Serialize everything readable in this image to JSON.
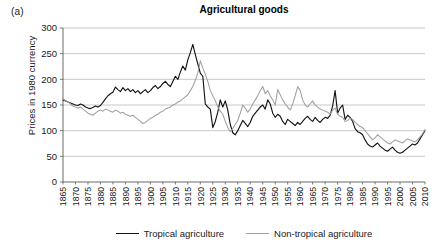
{
  "panel_label": "(a)",
  "title": "Agricultural goods",
  "legend": {
    "position": "bottom-center",
    "entries": [
      {
        "label": "Tropical agriculture",
        "color": "#141414",
        "icon": "line-swatch-black"
      },
      {
        "label": "Non-tropical agriculture",
        "color": "#a0a0a0",
        "icon": "line-swatch-gray"
      }
    ]
  },
  "chart_data": {
    "type": "line",
    "title": "Agricultural goods",
    "xlabel": "",
    "ylabel": "Prices in 1980 currency",
    "xlim": [
      1865,
      2010
    ],
    "ylim": [
      0,
      300
    ],
    "ytick_step": 50,
    "yticks": [
      0,
      50,
      100,
      150,
      200,
      250,
      300
    ],
    "ytick_labels": [
      "0",
      "50",
      "100",
      "150",
      "200",
      "250",
      "300"
    ],
    "xticks": [
      1865,
      1870,
      1875,
      1880,
      1885,
      1890,
      1895,
      1900,
      1905,
      1910,
      1915,
      1920,
      1925,
      1930,
      1935,
      1940,
      1945,
      1950,
      1955,
      1960,
      1965,
      1970,
      1975,
      1980,
      1985,
      1990,
      1995,
      2000,
      2005,
      2010
    ],
    "xtick_labels": [
      "1865",
      "1870",
      "1875",
      "1880",
      "1885",
      "1890",
      "1895",
      "1900",
      "1905",
      "1910",
      "1915",
      "1920",
      "1925",
      "1930",
      "1935",
      "1940",
      "1945",
      "1950",
      "1955",
      "1960",
      "1965",
      "1970",
      "1975",
      "1980",
      "1985",
      "1990",
      "1995",
      "2000",
      "2005",
      "2010"
    ],
    "xtick_rotation": -90,
    "grid": "horizontal",
    "x": [
      1865,
      1866,
      1867,
      1868,
      1869,
      1870,
      1871,
      1872,
      1873,
      1874,
      1875,
      1876,
      1877,
      1878,
      1879,
      1880,
      1881,
      1882,
      1883,
      1884,
      1885,
      1886,
      1887,
      1888,
      1889,
      1890,
      1891,
      1892,
      1893,
      1894,
      1895,
      1896,
      1897,
      1898,
      1899,
      1900,
      1901,
      1902,
      1903,
      1904,
      1905,
      1906,
      1907,
      1908,
      1909,
      1910,
      1911,
      1912,
      1913,
      1914,
      1915,
      1916,
      1917,
      1918,
      1919,
      1920,
      1921,
      1922,
      1923,
      1924,
      1925,
      1926,
      1927,
      1928,
      1929,
      1930,
      1931,
      1932,
      1933,
      1934,
      1935,
      1936,
      1937,
      1938,
      1939,
      1940,
      1941,
      1942,
      1943,
      1944,
      1945,
      1946,
      1947,
      1948,
      1949,
      1950,
      1951,
      1952,
      1953,
      1954,
      1955,
      1956,
      1957,
      1958,
      1959,
      1960,
      1961,
      1962,
      1963,
      1964,
      1965,
      1966,
      1967,
      1968,
      1969,
      1970,
      1971,
      1972,
      1973,
      1974,
      1975,
      1976,
      1977,
      1978,
      1979,
      1980,
      1981,
      1982,
      1983,
      1984,
      1985,
      1986,
      1987,
      1988,
      1989,
      1990,
      1991,
      1992,
      1993,
      1994,
      1995,
      1996,
      1997,
      1998,
      1999,
      2000,
      2001,
      2002,
      2003,
      2004,
      2005,
      2006,
      2007,
      2008,
      2009,
      2010
    ],
    "series": [
      {
        "name": "Tropical agriculture",
        "color": "#141414",
        "values": [
          160,
          158,
          156,
          154,
          152,
          150,
          149,
          152,
          150,
          146,
          144,
          143,
          145,
          148,
          146,
          149,
          155,
          162,
          168,
          172,
          175,
          185,
          180,
          176,
          184,
          178,
          182,
          176,
          180,
          174,
          178,
          172,
          176,
          180,
          174,
          178,
          184,
          188,
          182,
          186,
          192,
          196,
          190,
          186,
          196,
          206,
          200,
          214,
          226,
          218,
          238,
          252,
          268,
          248,
          230,
          212,
          206,
          152,
          146,
          142,
          106,
          118,
          136,
          160,
          146,
          158,
          140,
          112,
          96,
          92,
          100,
          110,
          120,
          114,
          108,
          116,
          128,
          134,
          140,
          146,
          150,
          142,
          160,
          152,
          134,
          126,
          132,
          128,
          118,
          112,
          122,
          118,
          114,
          110,
          116,
          112,
          118,
          124,
          128,
          122,
          118,
          126,
          120,
          116,
          122,
          126,
          124,
          130,
          148,
          178,
          134,
          144,
          150,
          122,
          130,
          126,
          118,
          104,
          98,
          96,
          92,
          82,
          74,
          70,
          68,
          72,
          76,
          70,
          66,
          62,
          60,
          64,
          68,
          62,
          58,
          56,
          58,
          62,
          66,
          70,
          74,
          72,
          76,
          84,
          92,
          100
        ]
      },
      {
        "name": "Non-tropical agriculture",
        "color": "#a0a0a0",
        "values": [
          162,
          158,
          156,
          152,
          148,
          146,
          144,
          146,
          142,
          138,
          134,
          132,
          130,
          134,
          138,
          140,
          138,
          142,
          140,
          138,
          136,
          140,
          138,
          134,
          136,
          132,
          130,
          128,
          130,
          126,
          122,
          118,
          114,
          116,
          120,
          124,
          126,
          130,
          132,
          136,
          138,
          142,
          144,
          146,
          150,
          152,
          156,
          158,
          162,
          166,
          170,
          178,
          186,
          198,
          212,
          236,
          222,
          210,
          196,
          178,
          168,
          158,
          146,
          138,
          132,
          118,
          106,
          98,
          104,
          112,
          120,
          134,
          150,
          144,
          136,
          142,
          152,
          160,
          168,
          178,
          186,
          172,
          178,
          168,
          160,
          150,
          180,
          170,
          160,
          152,
          146,
          140,
          152,
          168,
          186,
          178,
          160,
          150,
          146,
          152,
          158,
          150,
          146,
          142,
          140,
          138,
          136,
          132,
          140,
          144,
          132,
          128,
          126,
          118,
          120,
          124,
          122,
          116,
          112,
          108,
          106,
          100,
          94,
          88,
          82,
          86,
          92,
          88,
          84,
          80,
          76,
          74,
          78,
          82,
          80,
          78,
          76,
          80,
          84,
          82,
          80,
          78,
          82,
          88,
          94,
          102
        ]
      }
    ]
  }
}
